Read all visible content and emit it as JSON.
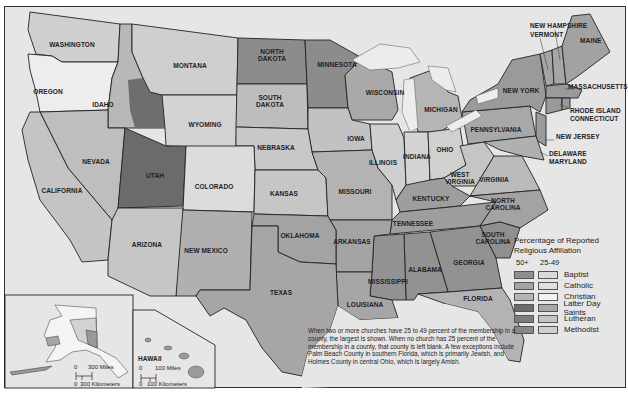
{
  "map": {
    "title": "Percentage of Reported Religious Affiliation",
    "states": [
      {
        "name": "WASHINGTON",
        "x": 72,
        "y": 45
      },
      {
        "name": "OREGON",
        "x": 48,
        "y": 92
      },
      {
        "name": "IDAHO",
        "x": 103,
        "y": 105
      },
      {
        "name": "MONTANA",
        "x": 190,
        "y": 66
      },
      {
        "name": "WYOMING",
        "x": 205,
        "y": 125
      },
      {
        "name": "NORTH DAKOTA",
        "x": 272,
        "y": 55
      },
      {
        "name": "SOUTH DAKOTA",
        "x": 270,
        "y": 101
      },
      {
        "name": "MINNESOTA",
        "x": 337,
        "y": 65
      },
      {
        "name": "WISCONSIN",
        "x": 385,
        "y": 93
      },
      {
        "name": "MICHIGAN",
        "x": 441,
        "y": 110
      },
      {
        "name": "NEVADA",
        "x": 96,
        "y": 162
      },
      {
        "name": "CALIFORNIA",
        "x": 62,
        "y": 191
      },
      {
        "name": "UTAH",
        "x": 155,
        "y": 176
      },
      {
        "name": "COLORADO",
        "x": 214,
        "y": 187
      },
      {
        "name": "NEBRASKA",
        "x": 276,
        "y": 148
      },
      {
        "name": "IOWA",
        "x": 356,
        "y": 139
      },
      {
        "name": "ILLINOIS",
        "x": 383,
        "y": 163
      },
      {
        "name": "INDIANA",
        "x": 417,
        "y": 157
      },
      {
        "name": "OHIO",
        "x": 445,
        "y": 150
      },
      {
        "name": "PENNSYLVANIA",
        "x": 496,
        "y": 130
      },
      {
        "name": "NEW YORK",
        "x": 521,
        "y": 91
      },
      {
        "name": "KANSAS",
        "x": 284,
        "y": 194
      },
      {
        "name": "MISSOURI",
        "x": 355,
        "y": 192
      },
      {
        "name": "WEST VIRGINIA",
        "x": 460,
        "y": 178
      },
      {
        "name": "VIRGINIA",
        "x": 494,
        "y": 180
      },
      {
        "name": "KENTUCKY",
        "x": 431,
        "y": 199
      },
      {
        "name": "ARIZONA",
        "x": 147,
        "y": 245
      },
      {
        "name": "NEW MEXICO",
        "x": 206,
        "y": 254
      },
      {
        "name": "OKLAHOMA",
        "x": 300,
        "y": 236
      },
      {
        "name": "ARKANSAS",
        "x": 352,
        "y": 242
      },
      {
        "name": "TENNESSEE",
        "x": 413,
        "y": 224
      },
      {
        "name": "NORTH CAROLINA",
        "x": 503,
        "y": 204
      },
      {
        "name": "SOUTH CAROLINA",
        "x": 493,
        "y": 238
      },
      {
        "name": "TEXAS",
        "x": 281,
        "y": 293
      },
      {
        "name": "LOUISIANA",
        "x": 365,
        "y": 305
      },
      {
        "name": "MISSISSIPPI",
        "x": 388,
        "y": 282
      },
      {
        "name": "ALABAMA",
        "x": 425,
        "y": 270
      },
      {
        "name": "GEORGIA",
        "x": 469,
        "y": 263
      },
      {
        "name": "FLORIDA",
        "x": 478,
        "y": 299
      }
    ],
    "callouts": [
      {
        "name": "NEW HAMPSHIRE",
        "x": 530,
        "y": 26
      },
      {
        "name": "VERMONT",
        "x": 530,
        "y": 35
      },
      {
        "name": "MAINE",
        "x": 580,
        "y": 41
      },
      {
        "name": "MASSACHUSETTS",
        "x": 568,
        "y": 87
      },
      {
        "name": "RHODE ISLAND",
        "x": 570,
        "y": 111
      },
      {
        "name": "CONNECTICUT",
        "x": 570,
        "y": 119
      },
      {
        "name": "NEW JERSEY",
        "x": 556,
        "y": 137
      },
      {
        "name": "DELAWARE",
        "x": 549,
        "y": 154
      },
      {
        "name": "MARYLAND",
        "x": 549,
        "y": 162
      }
    ],
    "insets": {
      "alaska": {
        "miles": "300 Miles",
        "km": "300 Kilometers",
        "zero": "0"
      },
      "hawaii": {
        "label": "HAWAII",
        "miles": "100 Miles",
        "km": "100 Kilometers",
        "zero": "0"
      }
    }
  },
  "legend": {
    "title": "Percentage of Reported Religious Affiliation",
    "col_50": "50+",
    "col_25": "25-49",
    "items": [
      {
        "label": "Baptist",
        "dark": "#8f8f8f",
        "light": "#d9d9d9"
      },
      {
        "label": "Catholic",
        "dark": "#a3a3a3",
        "light": "#e0e0e0"
      },
      {
        "label": "Christian",
        "dark": "#b5b5b5",
        "light": "#f2f2f2"
      },
      {
        "label": "Latter Day Saints",
        "dark": "#6b6b6b",
        "light": "#a8a8a8"
      },
      {
        "label": "Lutheran",
        "dark": "#7d7d7d",
        "light": "#c4c4c4"
      },
      {
        "label": "Methodist",
        "dark": "#888888",
        "light": "#cfcfcf"
      }
    ]
  },
  "note": "When two or more churches have 25 to 49 percent of the membership in a county, the largest is shown. When no church has 25 percent of the membership in a county, that county is left blank. A few exceptions include Palm Beach County in southern Florida, which is primarily Jewish, and Holmes County in central Ohio, which is largely Amish."
}
